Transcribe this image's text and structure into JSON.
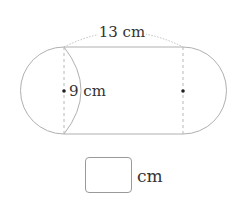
{
  "diagram": {
    "type": "stadium-shape",
    "length_label": "13 cm",
    "diameter_label": "9 cm",
    "colors": {
      "outline": "#b0b0b0",
      "dashed": "#b8b8b8",
      "dot": "#222222",
      "text": "#333333"
    }
  },
  "answer": {
    "value": "",
    "unit": "cm"
  }
}
